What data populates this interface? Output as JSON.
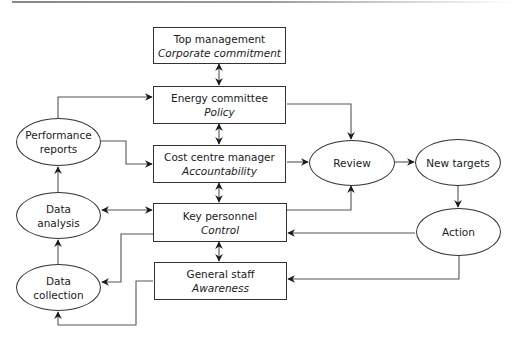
{
  "diagram": {
    "boxes": [
      {
        "id": "top-management",
        "title": "Top management",
        "subtitle": "Corporate commitment"
      },
      {
        "id": "energy-committee",
        "title": "Energy committee",
        "subtitle": "Policy"
      },
      {
        "id": "cost-centre-manager",
        "title": "Cost centre manager",
        "subtitle": "Accountability"
      },
      {
        "id": "key-personnel",
        "title": "Key personnel",
        "subtitle": "Control"
      },
      {
        "id": "general-staff",
        "title": "General staff",
        "subtitle": "Awareness"
      }
    ],
    "ellipses": [
      {
        "id": "performance-reports",
        "line1": "Performance",
        "line2": "reports"
      },
      {
        "id": "data-analysis",
        "line1": "Data",
        "line2": "analysis"
      },
      {
        "id": "data-collection",
        "line1": "Data",
        "line2": "collection"
      },
      {
        "id": "review",
        "line1": "Review",
        "line2": ""
      },
      {
        "id": "new-targets",
        "line1": "New targets",
        "line2": ""
      },
      {
        "id": "action",
        "line1": "Action",
        "line2": ""
      }
    ],
    "connections": [
      {
        "from": "top-management",
        "to": "energy-committee",
        "type": "bidirectional"
      },
      {
        "from": "energy-committee",
        "to": "cost-centre-manager",
        "type": "bidirectional"
      },
      {
        "from": "cost-centre-manager",
        "to": "key-personnel",
        "type": "bidirectional"
      },
      {
        "from": "key-personnel",
        "to": "general-staff",
        "type": "bidirectional"
      },
      {
        "from": "performance-reports",
        "to": "energy-committee",
        "type": "arrow"
      },
      {
        "from": "performance-reports",
        "to": "cost-centre-manager",
        "type": "arrow"
      },
      {
        "from": "data-analysis",
        "to": "key-personnel",
        "type": "bidirectional"
      },
      {
        "from": "data-analysis",
        "to": "performance-reports",
        "type": "arrow"
      },
      {
        "from": "data-collection",
        "to": "data-analysis",
        "type": "arrow"
      },
      {
        "from": "key-personnel",
        "to": "data-collection",
        "type": "arrow"
      },
      {
        "from": "general-staff",
        "to": "data-collection",
        "type": "arrow"
      },
      {
        "from": "energy-committee",
        "to": "review",
        "type": "arrow"
      },
      {
        "from": "cost-centre-manager",
        "to": "review",
        "type": "arrow"
      },
      {
        "from": "key-personnel",
        "to": "review",
        "type": "arrow"
      },
      {
        "from": "review",
        "to": "new-targets",
        "type": "arrow"
      },
      {
        "from": "new-targets",
        "to": "action",
        "type": "arrow"
      },
      {
        "from": "action",
        "to": "key-personnel",
        "type": "arrow"
      },
      {
        "from": "action",
        "to": "general-staff",
        "type": "arrow"
      }
    ]
  }
}
